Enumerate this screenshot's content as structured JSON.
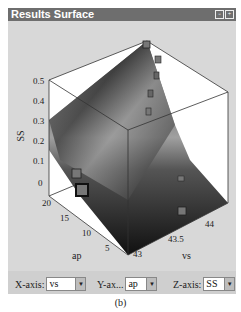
{
  "window": {
    "title": "Results Surface",
    "icons": [
      "restore-icon",
      "maximize-icon"
    ]
  },
  "plot": {
    "type": "3d-surface",
    "z_axis": {
      "label": "SS",
      "ticks": [
        "0.5",
        "0.4",
        "0.3",
        "0.2",
        "0.1",
        "0"
      ]
    },
    "y_axis": {
      "label": "ap",
      "ticks": [
        "20",
        "15",
        "10",
        "5"
      ]
    },
    "x_axis": {
      "label": "vs",
      "ticks": [
        "43",
        "43.5",
        "44"
      ]
    },
    "surface_color_low": "#1a1a1a",
    "surface_color_high": "#cfcfcf"
  },
  "controls": {
    "x_axis": {
      "label": "X-axis:",
      "value": "vs"
    },
    "y_axis": {
      "label": "Y-ax...",
      "value": "ap"
    },
    "z_axis": {
      "label": "Z-axis:",
      "value": "SS"
    }
  },
  "caption": "(b)"
}
